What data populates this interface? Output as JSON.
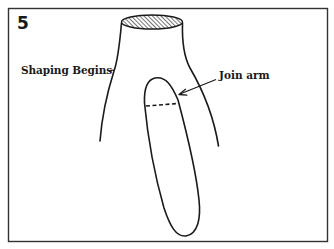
{
  "figure": {
    "step_number": "5",
    "labels": {
      "shaping": "Shaping Begins",
      "join": "Join arm"
    },
    "colors": {
      "ink": "#1a1a1a",
      "frame": "#333333",
      "background": "#ffffff"
    }
  }
}
